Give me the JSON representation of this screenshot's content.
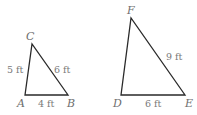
{
  "figure": {
    "triangle_small": {
      "vertices": {
        "A": "A",
        "B": "B",
        "C": "C"
      },
      "sides": {
        "AC": "5 ft",
        "CB": "6 ft",
        "AB": "4 ft"
      }
    },
    "triangle_large": {
      "vertices": {
        "D": "D",
        "E": "E",
        "F": "F"
      },
      "sides": {
        "FE": "9 ft",
        "DE": "6 ft"
      }
    },
    "colors": {
      "line": "#2a2a2a",
      "text": "#6e6e6e"
    }
  }
}
